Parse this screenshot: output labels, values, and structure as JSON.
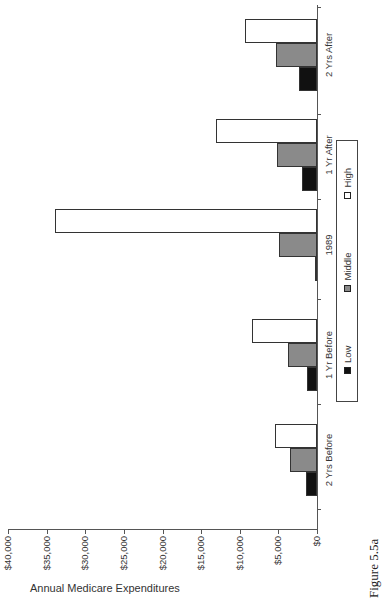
{
  "figure_caption": "Figure 5.5a",
  "chart_data": {
    "type": "bar",
    "title": "",
    "orientation": "vertical bars, page rotated 90° counter-clockwise",
    "xlabel": "",
    "ylabel": "Annual Medicare Expenditures",
    "ylim": [
      0,
      40000
    ],
    "yticks": [
      "$0",
      "$5,000",
      "$10,000",
      "$15,000",
      "$20,000",
      "$25,000",
      "$30,000",
      "$35,000",
      "$40,000"
    ],
    "categories": [
      "2 Yrs Before",
      "1 Yr Before",
      "1989",
      "1 Yr After",
      "2 Yrs After"
    ],
    "series": [
      {
        "name": "Low",
        "color": "#111111",
        "values": [
          1400,
          1300,
          200,
          1950,
          2300
        ]
      },
      {
        "name": "Middle",
        "color": "#8a8a8a",
        "values": [
          3500,
          3750,
          4900,
          5200,
          5300
        ]
      },
      {
        "name": "High",
        "color": "#ffffff",
        "values": [
          5450,
          8400,
          33900,
          13100,
          9300
        ]
      }
    ],
    "grid": false,
    "legend_position": "bottom"
  },
  "legend": {
    "items": [
      {
        "label": "Low",
        "color": "#111111"
      },
      {
        "label": "Middle",
        "color": "#8a8a8a"
      },
      {
        "label": "High",
        "color": "#ffffff"
      }
    ]
  }
}
